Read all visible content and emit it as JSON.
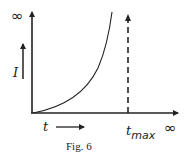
{
  "figure": {
    "caption": "Fig. 6",
    "y_axis": {
      "label": "I",
      "top_label": "∞"
    },
    "x_axis": {
      "label": "t",
      "marker_label_main": "t",
      "marker_label_sub": "max",
      "end_label": "∞"
    },
    "curve": {
      "description": "I increases monotonically with t, diverging to infinity as t approaches t_max",
      "asymptote": "t_max"
    },
    "colors": {
      "ink": "#222222",
      "background": "#ffffff"
    }
  }
}
